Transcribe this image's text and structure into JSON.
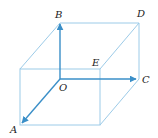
{
  "diagram": {
    "type": "cube-vectors",
    "colors": {
      "edge": "#9ccbe8",
      "vector": "#3a8fc8",
      "label": "#222222"
    },
    "labels": {
      "A": "A",
      "B": "B",
      "C": "C",
      "D": "D",
      "E": "E",
      "O": "O"
    },
    "vectors": [
      {
        "from": "O",
        "to": "A"
      },
      {
        "from": "O",
        "to": "B"
      },
      {
        "from": "O",
        "to": "C"
      }
    ]
  }
}
